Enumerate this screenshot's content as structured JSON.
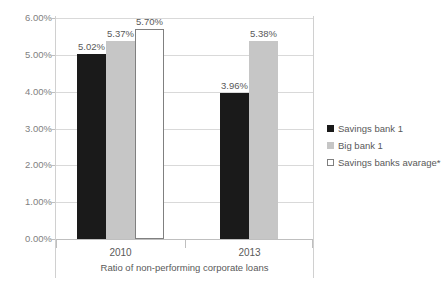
{
  "chart_data": {
    "type": "bar",
    "title": "",
    "subtitle": "",
    "xlabel": "Ratio of non-performing corporate loans",
    "ylabel": "",
    "categories": [
      "2010",
      "2013"
    ],
    "series": [
      {
        "name": "Savings bank 1",
        "values": [
          5.02,
          3.96
        ],
        "color": "#1a1a1a",
        "swatch": "filled-dark"
      },
      {
        "name": "Big bank 1",
        "values": [
          5.37,
          5.38
        ],
        "color": "#c6c6c6",
        "swatch": "filled-gray"
      },
      {
        "name": "Savings banks avarage*",
        "values": [
          5.7,
          null
        ],
        "color": "#ffffff",
        "swatch": "outline-white"
      }
    ],
    "data_labels": [
      [
        "5.02%",
        "3.96%"
      ],
      [
        "5.37%",
        "5.38%"
      ],
      [
        "5.70%",
        ""
      ]
    ],
    "ylim": [
      0.0,
      6.0
    ],
    "ytick_values": [
      0.0,
      1.0,
      2.0,
      3.0,
      4.0,
      5.0,
      6.0
    ],
    "ytick_labels": [
      "0.00%",
      "1.00%",
      "2.00%",
      "3.00%",
      "4.00%",
      "5.00%",
      "6.00%"
    ],
    "value_suffix": "%",
    "grid": true,
    "grid_axis": "y",
    "legend_position": "right",
    "footnote_marker": "*"
  },
  "colors": {
    "background": "#ffffff",
    "gridline": "#d9d9d9",
    "axis": "#bfbfbf",
    "text": "#595959",
    "tick_text": "#7f7f7f",
    "frame": "#d0d0d0"
  }
}
